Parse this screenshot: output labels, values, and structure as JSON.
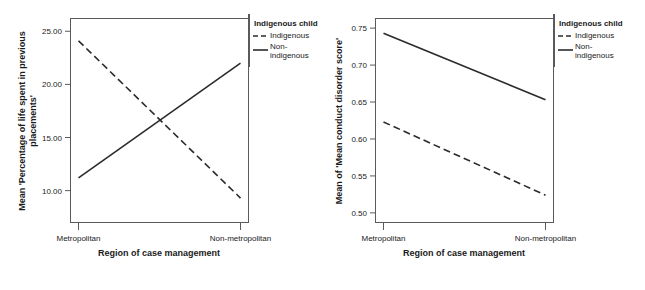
{
  "chart_data": [
    {
      "id": "left",
      "type": "line",
      "title": "",
      "xlabel": "Region of case management",
      "ylabel": "Mean 'Percentage of life spent in previous placements'",
      "categories": [
        "Metropolitan",
        "Non-metropolitan"
      ],
      "yticks": [
        "25.00",
        "20.00",
        "15.00",
        "10.00"
      ],
      "ytickvalues": [
        25.0,
        20.0,
        15.0,
        10.0
      ],
      "ylim": [
        7.0,
        26.2
      ],
      "grid": false,
      "legend": {
        "title": "Indigenous child",
        "position": "right",
        "entries": [
          {
            "label": "Indigenous",
            "style": "dashed"
          },
          {
            "label": "Non-indigenous",
            "style": "solid"
          }
        ]
      },
      "series": [
        {
          "name": "Indigenous",
          "style": "dashed",
          "values": [
            24.1,
            9.3
          ]
        },
        {
          "name": "Non-indigenous",
          "style": "solid",
          "values": [
            11.2,
            22.0
          ]
        }
      ]
    },
    {
      "id": "right",
      "type": "line",
      "title": "",
      "xlabel": "Region of case management",
      "ylabel": "Mean of 'Mean conduct disorder score'",
      "categories": [
        "Metropolitan",
        "Non-metropolitan"
      ],
      "yticks": [
        "0.75",
        "0.70",
        "0.65",
        "0.60",
        "0.55",
        "0.50"
      ],
      "ytickvalues": [
        0.75,
        0.7,
        0.65,
        0.6,
        0.55,
        0.5
      ],
      "ylim": [
        0.487,
        0.763
      ],
      "grid": false,
      "legend": {
        "title": "Indigenous child",
        "position": "right",
        "entries": [
          {
            "label": "Indigenous",
            "style": "dashed"
          },
          {
            "label": "Non-indigenous",
            "style": "solid"
          }
        ]
      },
      "series": [
        {
          "name": "Indigenous",
          "style": "dashed",
          "values": [
            0.623,
            0.524
          ]
        },
        {
          "name": "Non-indigenous",
          "style": "solid",
          "values": [
            0.743,
            0.653
          ]
        }
      ]
    }
  ],
  "figures": {
    "left": {
      "ylabel_line1": "Mean 'Percentage of life spent in previous",
      "ylabel_line2": "placements'",
      "xlabel": "Region of case management",
      "cat0": "Metropolitan",
      "cat1": "Non-metropolitan",
      "ytick0": "25.00",
      "ytick1": "20.00",
      "ytick2": "15.00",
      "ytick3": "10.00",
      "legend_title": "Indigenous child",
      "legend_entry0": "Indigenous",
      "legend_entry1_line1": "Non-",
      "legend_entry1_line2": "indigenous"
    },
    "right": {
      "ylabel": "Mean of 'Mean conduct disorder score'",
      "xlabel": "Region of case management",
      "cat0": "Metropolitan",
      "cat1": "Non-metropolitan",
      "ytick0": "0.75",
      "ytick1": "0.70",
      "ytick2": "0.65",
      "ytick3": "0.60",
      "ytick4": "0.55",
      "ytick5": "0.50",
      "legend_title": "Indigenous child",
      "legend_entry0": "Indigenous",
      "legend_entry1_line1": "Non-",
      "legend_entry1_line2": "indigenous"
    }
  },
  "colors": {
    "line": "#2b2b2b",
    "frame": "#5a5a5a",
    "background": "#ffffff",
    "text": "#1a1a1a"
  }
}
